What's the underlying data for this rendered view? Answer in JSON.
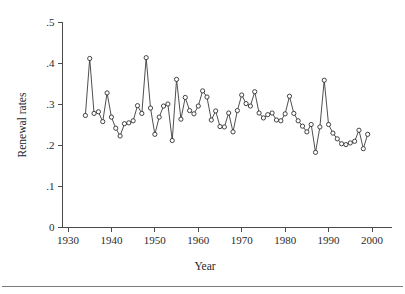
{
  "chart_data": {
    "type": "line",
    "title": "",
    "subtitle": "",
    "xlabel": "Year",
    "ylabel": "Renewal rates",
    "xlim": [
      1928,
      2002
    ],
    "ylim": [
      0,
      0.5
    ],
    "grid": false,
    "legend": null,
    "legend_position": "none",
    "marker": "open-circle",
    "x_ticks": [
      1930,
      1940,
      1950,
      1960,
      1970,
      1980,
      1990,
      2000
    ],
    "x_tick_labels": [
      "1930",
      "1940",
      "1950",
      "1960",
      "1970",
      "1980",
      "1990",
      "2000"
    ],
    "y_ticks": [
      0,
      0.1,
      0.2,
      0.3,
      0.4,
      0.5
    ],
    "y_tick_labels": [
      "0",
      ".1",
      ".2",
      ".3",
      ".4",
      ".5"
    ],
    "x": [
      1934,
      1935,
      1936,
      1937,
      1938,
      1939,
      1940,
      1941,
      1942,
      1943,
      1944,
      1945,
      1946,
      1947,
      1948,
      1949,
      1950,
      1951,
      1952,
      1953,
      1954,
      1955,
      1956,
      1957,
      1958,
      1959,
      1960,
      1961,
      1962,
      1963,
      1964,
      1965,
      1966,
      1967,
      1968,
      1969,
      1970,
      1971,
      1972,
      1973,
      1974,
      1975,
      1976,
      1977,
      1978,
      1979,
      1980,
      1981,
      1982,
      1983,
      1984,
      1985,
      1986,
      1987,
      1988,
      1989,
      1990,
      1991,
      1992,
      1993,
      1994,
      1995,
      1996,
      1997,
      1998,
      1999
    ],
    "values": [
      0.272,
      0.411,
      0.277,
      0.281,
      0.257,
      0.327,
      0.268,
      0.241,
      0.222,
      0.252,
      0.254,
      0.259,
      0.296,
      0.277,
      0.413,
      0.29,
      0.226,
      0.268,
      0.295,
      0.3,
      0.211,
      0.36,
      0.263,
      0.316,
      0.284,
      0.276,
      0.295,
      0.332,
      0.317,
      0.261,
      0.283,
      0.245,
      0.244,
      0.278,
      0.232,
      0.284,
      0.322,
      0.301,
      0.295,
      0.33,
      0.278,
      0.266,
      0.274,
      0.278,
      0.261,
      0.259,
      0.276,
      0.319,
      0.277,
      0.259,
      0.246,
      0.232,
      0.25,
      0.182,
      0.244,
      0.358,
      0.25,
      0.229,
      0.215,
      0.203,
      0.201,
      0.205,
      0.209,
      0.236,
      0.191,
      0.226
    ],
    "series": [
      {
        "name": "Renewal rates",
        "values": [
          0.272,
          0.411,
          0.277,
          0.281,
          0.257,
          0.327,
          0.268,
          0.241,
          0.222,
          0.252,
          0.254,
          0.259,
          0.296,
          0.277,
          0.413,
          0.29,
          0.226,
          0.268,
          0.295,
          0.3,
          0.211,
          0.36,
          0.263,
          0.316,
          0.284,
          0.276,
          0.295,
          0.332,
          0.317,
          0.261,
          0.283,
          0.245,
          0.244,
          0.278,
          0.232,
          0.284,
          0.322,
          0.301,
          0.295,
          0.33,
          0.278,
          0.266,
          0.274,
          0.278,
          0.261,
          0.259,
          0.276,
          0.319,
          0.277,
          0.259,
          0.246,
          0.232,
          0.25,
          0.182,
          0.244,
          0.358,
          0.25,
          0.229,
          0.215,
          0.203,
          0.201,
          0.205,
          0.209,
          0.236,
          0.191,
          0.226
        ]
      }
    ]
  },
  "colors": {
    "line": "#3b3b3b",
    "marker_stroke": "#2f2f2f",
    "marker_fill": "#ffffff",
    "axis": "#4a4a4a",
    "text": "#1f1f1f",
    "background": "#ffffff",
    "footer_rule": "#7a7a7a"
  }
}
